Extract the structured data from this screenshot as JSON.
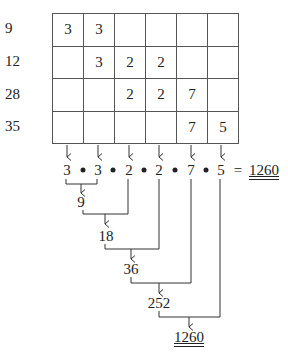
{
  "row_labels": [
    "9",
    "12",
    "28",
    "35"
  ],
  "grid": {
    "rows": [
      [
        "3",
        "3",
        "",
        "",
        "",
        ""
      ],
      [
        "",
        "3",
        "2",
        "2",
        "",
        ""
      ],
      [
        "",
        "",
        "2",
        "2",
        "7",
        ""
      ],
      [
        "",
        "",
        "",
        "",
        "7",
        "5"
      ]
    ]
  },
  "product_row": {
    "factors": [
      "3",
      "3",
      "2",
      "2",
      "7",
      "5"
    ],
    "operator": "•",
    "equals": "=",
    "result": "1260"
  },
  "cascade": {
    "steps": [
      "9",
      "18",
      "36",
      "252",
      "1260"
    ]
  }
}
